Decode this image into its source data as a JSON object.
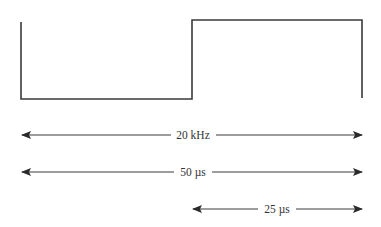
{
  "diagram": {
    "type": "square-wave-timing",
    "colors": {
      "background": "#ffffff",
      "waveform": "#3a3a3a",
      "arrow": "#3a3a3a",
      "text": "#333333"
    },
    "waveform": {
      "description": "One cycle of a square wave: low half then high half",
      "points": [
        [
          21,
          22
        ],
        [
          21,
          99
        ],
        [
          192,
          99
        ],
        [
          192,
          20
        ],
        [
          362,
          20
        ],
        [
          362,
          98
        ]
      ]
    },
    "dimensions": [
      {
        "id": "frequency",
        "label": "20 kHz",
        "y": 135,
        "x_start": 22,
        "x_end": 362,
        "label_x": 193
      },
      {
        "id": "period",
        "label": "50 µs",
        "y": 172,
        "x_start": 22,
        "x_end": 362,
        "label_x": 193
      },
      {
        "id": "half-period",
        "label": "25 µs",
        "y": 209,
        "x_start": 193,
        "x_end": 362,
        "label_x": 277
      }
    ]
  }
}
